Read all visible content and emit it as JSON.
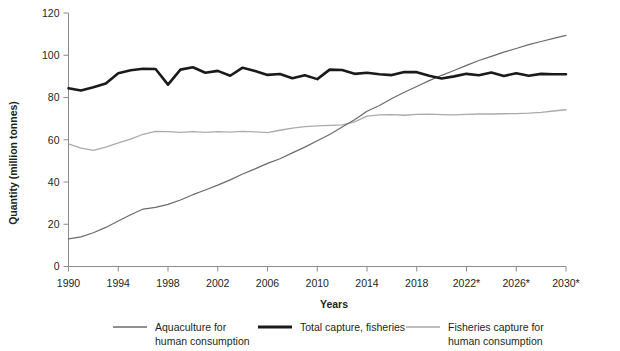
{
  "chart_data": {
    "type": "line",
    "title": "",
    "xlabel": "Years",
    "ylabel": "Quantity (million tonnes)",
    "xlim": [
      1990,
      2030
    ],
    "ylim": [
      0,
      120
    ],
    "grid": false,
    "legend_position": "bottom",
    "x": [
      1990,
      1991,
      1992,
      1993,
      1994,
      1995,
      1996,
      1997,
      1998,
      1999,
      2000,
      2001,
      2002,
      2003,
      2004,
      2005,
      2006,
      2007,
      2008,
      2009,
      2010,
      2011,
      2012,
      2013,
      2014,
      2015,
      2016,
      2017,
      2018,
      2019,
      2020,
      2021,
      2022,
      2023,
      2024,
      2025,
      2026,
      2027,
      2028,
      2029,
      2030
    ],
    "xtick_values": [
      1990,
      1994,
      1998,
      2002,
      2006,
      2010,
      2014,
      2018,
      2022,
      2026,
      2030
    ],
    "xtick_labels": [
      "1990",
      "1994",
      "1998",
      "2002",
      "2006",
      "2010",
      "2014",
      "2018",
      "2022*",
      "2026*",
      "2030*"
    ],
    "ytick_values": [
      0,
      20,
      40,
      60,
      80,
      100,
      120
    ],
    "ytick_labels": [
      "0",
      "20",
      "40",
      "60",
      "80",
      "100",
      "120"
    ],
    "series": [
      {
        "name": "Aquaculture for human consumption",
        "legend_label_line1": "Aquaculture for",
        "legend_label_line2": "human consumption",
        "color": "#6b6b6b",
        "width": 1.2,
        "values": [
          13.1,
          14.0,
          16.0,
          18.5,
          21.5,
          24.5,
          27.2,
          28.0,
          29.4,
          31.5,
          34.0,
          36.2,
          38.5,
          41.0,
          43.8,
          46.2,
          48.8,
          51.0,
          53.8,
          56.5,
          59.5,
          62.5,
          66.0,
          69.5,
          73.5,
          76.2,
          79.5,
          82.5,
          85.2,
          88.0,
          90.5,
          92.8,
          95.2,
          97.5,
          99.5,
          101.5,
          103.2,
          105.0,
          106.5,
          108.0,
          109.4
        ]
      },
      {
        "name": "Total capture, fisheries",
        "legend_label_line1": "Total capture, fisheries",
        "legend_label_line2": "",
        "color": "#1a1a1a",
        "width": 2.6,
        "values": [
          84.4,
          83.3,
          84.8,
          86.6,
          91.5,
          92.9,
          93.6,
          93.5,
          86.1,
          93.2,
          94.3,
          91.7,
          92.6,
          90.3,
          94.1,
          92.5,
          90.7,
          91.1,
          89.1,
          90.5,
          88.7,
          93.2,
          93.0,
          91.2,
          91.7,
          91.0,
          90.6,
          92.1,
          92.0,
          90.3,
          89.0,
          90.0,
          91.2,
          90.5,
          91.8,
          90.2,
          91.5,
          90.3,
          91.2,
          91.0,
          91.0
        ]
      },
      {
        "name": "Fisheries capture for human consumption",
        "legend_label_line1": "Fisheries capture for",
        "legend_label_line2": "human consumption",
        "color": "#aaaaaa",
        "width": 1.3,
        "values": [
          58.0,
          56.0,
          55.0,
          56.5,
          58.5,
          60.3,
          62.6,
          64.0,
          63.8,
          63.5,
          63.8,
          63.5,
          63.8,
          63.6,
          64.0,
          63.7,
          63.4,
          64.5,
          65.5,
          66.2,
          66.6,
          66.8,
          67.0,
          68.5,
          71.2,
          71.8,
          71.9,
          71.6,
          72.0,
          72.1,
          71.9,
          71.8,
          72.0,
          72.2,
          72.2,
          72.3,
          72.4,
          72.6,
          73.0,
          73.6,
          74.2
        ]
      }
    ],
    "note": "* denotes projected years"
  },
  "axes": {
    "ylabel_text": "Quantity (million tonnes)",
    "xlabel_text": "Years"
  }
}
